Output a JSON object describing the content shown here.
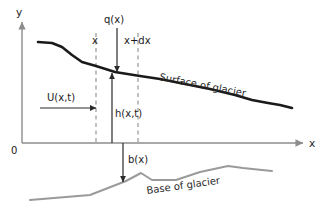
{
  "figure": {
    "axes": {
      "y_label": "y",
      "x_label": "x",
      "origin_label": "0",
      "axis_color": "#8c8c8c"
    },
    "labels": {
      "q": "q(x)",
      "x_station": "x",
      "x_plus_dx": "x+dx",
      "velocity": "U(x,t)",
      "thickness": "h(x,t)",
      "bed_elevation": "b(x)",
      "surface": "Surface of glacier",
      "base": "Base of glacier"
    },
    "colors": {
      "surface_curve": "#1a1a1a",
      "base_curve": "#9a9a9a",
      "axis": "#8c8c8c",
      "dashed": "#8c8c8c",
      "arrow": "#2b2b2b",
      "text": "#1a1a1a"
    },
    "geometry": {
      "y_axis_x": 22,
      "x_axis_y": 143,
      "x_axis_end": 303,
      "y_axis_top": 20,
      "dashed_x_station": 96,
      "dashed_x_plus_dx": 138,
      "q_arrow_x": 117,
      "h_arrow_x": 112,
      "b_arrow_x": 123,
      "u_arrow_y": 108,
      "surface_points": "38,42 52,43 62,47 72,55 82,62 96,66 115,72 140,76 160,79 185,84 210,89 235,95 252,100 268,103 280,105 292,108",
      "base_points": "30,200 66,197 90,195 126,181 141,173 152,180 176,180 200,172 228,166 243,168 262,170 272,171"
    }
  }
}
